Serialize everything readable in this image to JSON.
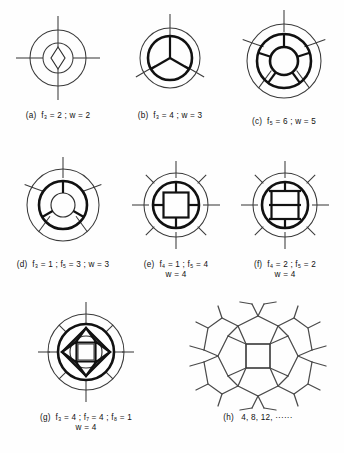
{
  "figure": {
    "background_color": "#fefefe",
    "line_color": "#3a3a3a",
    "bold_line_color": "#111111",
    "rows": 3,
    "panel_count": 8
  },
  "panels": [
    {
      "id": "a",
      "label": "(a)",
      "caption_line1": "(a)  f3 = 2 ; w = 2",
      "caption_line2": "",
      "f_symbol": "f3",
      "f_value": 2,
      "w_value": 2,
      "outer_spokes": 4,
      "rings": 2,
      "core_shape": "lens-diamond"
    },
    {
      "id": "b",
      "label": "(b)",
      "caption_line1": "(b)  f3 = 4 ; w = 3",
      "caption_line2": "",
      "f_symbol": "f3",
      "f_value": 4,
      "w_value": 3,
      "outer_spokes": 3,
      "rings": 2,
      "core_shape": "three-sector-disc"
    },
    {
      "id": "c",
      "label": "(c)",
      "caption_line1": "(c)  f5 = 6 ; w = 5",
      "caption_line2": "",
      "f_symbol": "f5",
      "f_value": 6,
      "w_value": 5,
      "outer_spokes": 5,
      "rings": 3,
      "core_shape": "five-sector-annulus"
    },
    {
      "id": "d",
      "label": "(d)",
      "caption_line1": "(d)  f3 = 1 ; f5 = 3 ; w = 3",
      "caption_line2": "",
      "f_symbol": "f3,f5",
      "f_value": 1,
      "w_value": 3,
      "outer_spokes": 5,
      "rings": 3,
      "core_shape": "three-sector-annulus"
    },
    {
      "id": "e",
      "label": "(e)",
      "caption_line1": "(e)  f4 = 1 ; f5 = 4",
      "caption_line2": "w = 4",
      "f_symbol": "f4,f5",
      "f_value": 1,
      "w_value": 4,
      "outer_spokes": 4,
      "rings": 2,
      "core_shape": "inscribed-square"
    },
    {
      "id": "f",
      "label": "(f)",
      "caption_line1": "(f)  f4 = 2 ; f5 = 2",
      "caption_line2": "w = 4",
      "f_symbol": "f4,f5",
      "f_value": 2,
      "w_value": 4,
      "outer_spokes": 4,
      "rings": 2,
      "core_shape": "ladder-bars"
    },
    {
      "id": "g",
      "label": "(g)",
      "caption_line1": "(g)  f3 = 4 ; f7 = 4 ; f8 = 1",
      "caption_line2": "w = 4",
      "f_symbol": "f3,f7,f8",
      "f_value": 4,
      "w_value": 4,
      "outer_spokes": 4,
      "rings": 3,
      "core_shape": "diamond-with-wedges"
    },
    {
      "id": "h",
      "label": "(h)",
      "caption_line1": "(h)  4, 8, 12, ······",
      "caption_line2": "",
      "f_symbol": "",
      "f_value": null,
      "w_value": null,
      "outer_spokes": 0,
      "rings": 0,
      "core_shape": "polygon-network",
      "sequence": [
        4,
        8,
        12
      ]
    }
  ],
  "captions": {
    "a": "(a)  f₃ = 2 ; w = 2",
    "b": "(b)  f₃ = 4 ; w = 3",
    "c": "(c)  f₅ = 6 ; w = 5",
    "d": "(d)  f₃ = 1 ; f₅ = 3 ; w = 3",
    "e1": "(e)  f₄ = 1 ; f₅ = 4",
    "e2": "w = 4",
    "f1": "(f)  f₄ = 2 ; f₅ = 2",
    "f2": "w = 4",
    "g1": "(g)  f₃ = 4 ; f₇ = 4 ; f₈ = 1",
    "g2": "w = 4",
    "h": "(h)   4, 8, 12, ······"
  }
}
